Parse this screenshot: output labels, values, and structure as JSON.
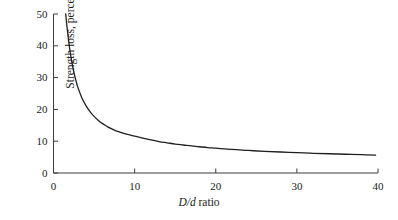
{
  "chart_data": {
    "type": "line",
    "title": "",
    "subtitle": "",
    "xlabel_parts": {
      "italic": "D/d",
      "plain": " ratio"
    },
    "xlabel": "D/d ratio",
    "ylabel": "Strength loss, percent",
    "xlim": [
      0,
      40
    ],
    "ylim": [
      0,
      50
    ],
    "xticks": [
      0,
      10,
      20,
      30,
      40
    ],
    "yticks": [
      0,
      10,
      20,
      30,
      40,
      50
    ],
    "xtick_labels": [
      "0",
      "10",
      "20",
      "30",
      "40"
    ],
    "ytick_labels": [
      "0",
      "10",
      "20",
      "30",
      "40",
      "50"
    ],
    "grid": false,
    "legend": null,
    "legend_position": "none",
    "line_color": "#1f1f1f",
    "line_width": 1.3,
    "background_color": "#ffffff",
    "axis_color": "#3c3c3c",
    "series": [
      {
        "name": "Strength loss",
        "x": [
          1.5,
          1.75,
          2,
          2.25,
          2.5,
          2.75,
          3,
          3.5,
          4,
          4.5,
          5,
          5.5,
          6,
          6.5,
          7,
          7.5,
          8,
          9,
          10,
          11,
          12,
          13,
          14,
          15,
          16,
          17,
          18,
          19,
          20,
          22,
          24,
          26,
          28,
          30,
          32,
          34,
          36,
          38,
          39.7
        ],
        "y": [
          50.0,
          44.0,
          39.0,
          35.0,
          31.8,
          29.2,
          27.0,
          23.6,
          21.2,
          19.3,
          17.8,
          16.6,
          15.6,
          14.8,
          14.1,
          13.5,
          13.0,
          12.2,
          11.6,
          11.0,
          10.4,
          9.9,
          9.5,
          9.1,
          8.8,
          8.5,
          8.25,
          8.0,
          7.8,
          7.4,
          7.1,
          6.8,
          6.6,
          6.4,
          6.2,
          6.05,
          5.9,
          5.75,
          5.6
        ]
      }
    ],
    "annotations": []
  }
}
